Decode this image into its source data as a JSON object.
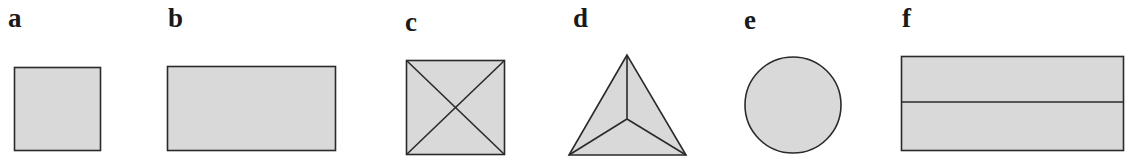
{
  "colors": {
    "fill": "#d9d9d9",
    "stroke": "#2a2a2a",
    "background": "#ffffff"
  },
  "figures": [
    {
      "label": "a",
      "shape": "square"
    },
    {
      "label": "b",
      "shape": "rectangle"
    },
    {
      "label": "c",
      "shape": "square with both diagonals"
    },
    {
      "label": "d",
      "shape": "triangle divided into three from center"
    },
    {
      "label": "e",
      "shape": "circle"
    },
    {
      "label": "f",
      "shape": "rectangle divided into two halves horizontally"
    }
  ]
}
